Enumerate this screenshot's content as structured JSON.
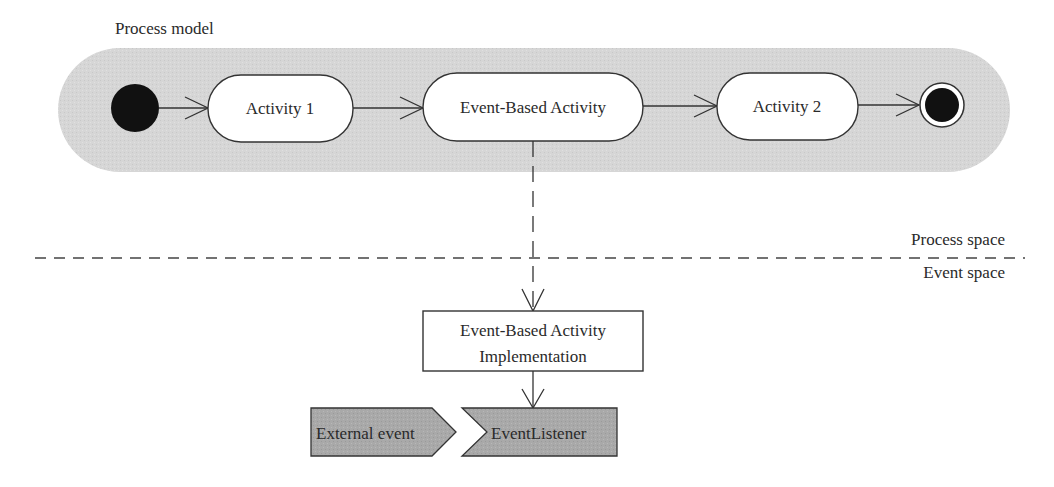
{
  "diagram": {
    "title": "Process model",
    "colors": {
      "band": "#d6d6d6",
      "node_fill": "#ffffff",
      "stroke": "#333333",
      "event_fill": "#a9a9a9",
      "terminal": "#111111"
    },
    "process_model": {
      "start_node": {
        "type": "initial"
      },
      "activities": [
        {
          "id": "activity1",
          "label": "Activity 1"
        },
        {
          "id": "event_based_activity",
          "label": "Event-Based Activity"
        },
        {
          "id": "activity2",
          "label": "Activity 2"
        }
      ],
      "end_node": {
        "type": "final"
      }
    },
    "separator": {
      "upper_label": "Process space",
      "lower_label": "Event space"
    },
    "implementation": {
      "line1": "Event-Based Activity",
      "line2": "Implementation"
    },
    "events": {
      "external_event": "External event",
      "event_listener": "EventListener"
    },
    "edges": [
      {
        "from": "start",
        "to": "Activity 1",
        "style": "solid"
      },
      {
        "from": "Activity 1",
        "to": "Event-Based Activity",
        "style": "solid"
      },
      {
        "from": "Event-Based Activity",
        "to": "Activity 2",
        "style": "solid"
      },
      {
        "from": "Activity 2",
        "to": "end",
        "style": "solid"
      },
      {
        "from": "Event-Based Activity",
        "to": "Event-Based Activity Implementation",
        "style": "dashed"
      },
      {
        "from": "Event-Based Activity Implementation",
        "to": "EventListener",
        "style": "solid"
      }
    ]
  }
}
